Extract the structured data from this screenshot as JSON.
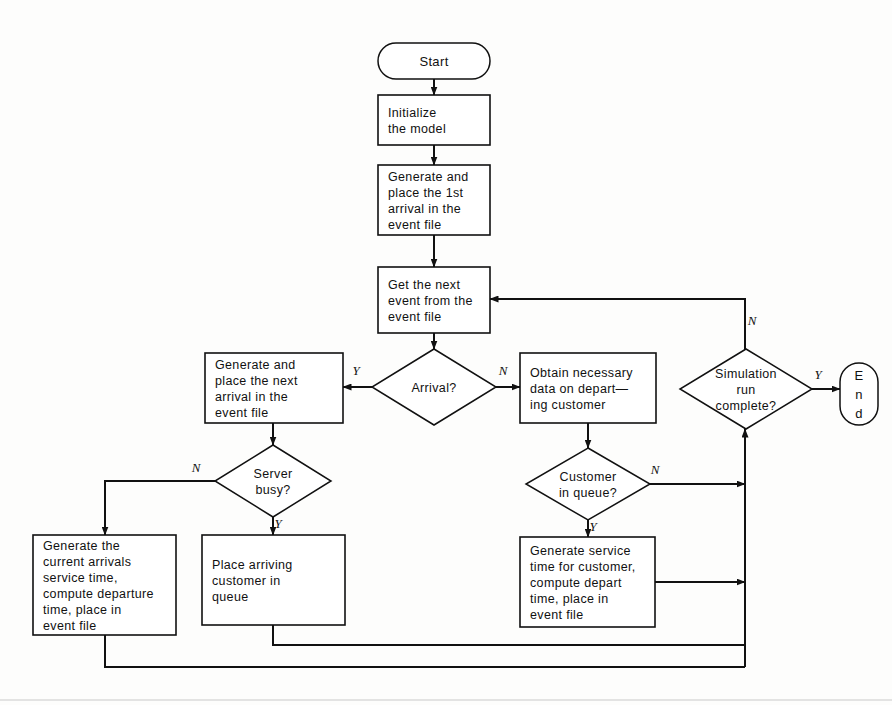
{
  "diagram": {
    "type": "flowchart",
    "canvas": {
      "width": 892,
      "height": 705
    },
    "colors": {
      "stroke": "#111111",
      "fill": "#ffffff",
      "background": "#fdfdfc"
    }
  },
  "nodes": {
    "start": {
      "id": "start",
      "shape": "terminal",
      "label": "Start",
      "lines": [
        "Start"
      ],
      "x": 378,
      "y": 43,
      "w": 112,
      "h": 36
    },
    "initialize": {
      "id": "initialize",
      "shape": "process",
      "lines": [
        "Initialize",
        "the model"
      ],
      "x": 378,
      "y": 95,
      "w": 112,
      "h": 50
    },
    "first_arrival": {
      "id": "first_arrival",
      "shape": "process",
      "lines": [
        "Generate and",
        "place the 1st",
        "arrival in the",
        "event file"
      ],
      "x": 378,
      "y": 165,
      "w": 112,
      "h": 70
    },
    "get_event": {
      "id": "get_event",
      "shape": "process",
      "lines": [
        "Get the next",
        "event from the",
        "event file"
      ],
      "x": 378,
      "y": 267,
      "w": 112,
      "h": 66
    },
    "arrival_q": {
      "id": "arrival_q",
      "shape": "decision",
      "lines": [
        "Arrival?"
      ],
      "cx": 434,
      "cy": 387,
      "rx": 62,
      "ry": 38
    },
    "next_arrival": {
      "id": "next_arrival",
      "shape": "process",
      "lines": [
        "Generate and",
        "place the next",
        "arrival in the",
        "event file"
      ],
      "x": 205,
      "y": 353,
      "w": 138,
      "h": 70
    },
    "obtain_data": {
      "id": "obtain_data",
      "shape": "process",
      "lines": [
        "Obtain necessary",
        "data on depart—",
        "ing customer"
      ],
      "x": 520,
      "y": 353,
      "w": 136,
      "h": 70
    },
    "sim_complete_q": {
      "id": "sim_complete_q",
      "shape": "decision",
      "lines": [
        "Simulation",
        "run",
        "complete?"
      ],
      "cx": 746,
      "cy": 389,
      "rx": 66,
      "ry": 40
    },
    "end": {
      "id": "end",
      "shape": "terminal",
      "label": "End",
      "lines": [
        "E",
        "n",
        "d"
      ],
      "x": 840,
      "y": 363,
      "w": 38,
      "h": 62
    },
    "server_busy_q": {
      "id": "server_busy_q",
      "shape": "decision",
      "lines": [
        "Server",
        "busy?"
      ],
      "cx": 273,
      "cy": 481,
      "rx": 58,
      "ry": 36
    },
    "customer_queue_q": {
      "id": "customer_queue_q",
      "shape": "decision",
      "lines": [
        "Customer",
        "in queue?"
      ],
      "cx": 588,
      "cy": 484,
      "rx": 62,
      "ry": 36
    },
    "gen_current_arrival": {
      "id": "gen_current_arrival",
      "shape": "process",
      "lines": [
        "Generate the",
        "current arrivals",
        "service time,",
        "compute departure",
        "time, place in",
        "event file"
      ],
      "x": 33,
      "y": 535,
      "w": 143,
      "h": 100
    },
    "place_customer": {
      "id": "place_customer",
      "shape": "process",
      "lines": [
        "Place arriving",
        "customer in",
        "queue"
      ],
      "x": 202,
      "y": 535,
      "w": 143,
      "h": 90
    },
    "gen_service_time": {
      "id": "gen_service_time",
      "shape": "process",
      "lines": [
        "Generate service",
        "time for customer,",
        "compute depart",
        "time, place in",
        "event file"
      ],
      "x": 520,
      "y": 537,
      "w": 135,
      "h": 90
    }
  },
  "edges": [
    {
      "id": "e-start-init",
      "from": "start",
      "to": "initialize",
      "label": "",
      "arrow": true,
      "points": "434,79 434,95"
    },
    {
      "id": "e-init-first",
      "from": "initialize",
      "to": "first_arrival",
      "label": "",
      "arrow": true,
      "points": "434,145 434,165"
    },
    {
      "id": "e-first-get",
      "from": "first_arrival",
      "to": "get_event",
      "label": "",
      "arrow": true,
      "points": "434,235 434,267"
    },
    {
      "id": "e-get-arrival",
      "from": "get_event",
      "to": "arrival_q",
      "label": "",
      "arrow": true,
      "points": "434,333 434,349"
    },
    {
      "id": "e-arrival-yes",
      "from": "arrival_q",
      "to": "next_arrival",
      "label": "Y",
      "arrow": true,
      "points": "372,387 343,387",
      "label_x": 356,
      "label_y": 375
    },
    {
      "id": "e-arrival-no",
      "from": "arrival_q",
      "to": "obtain_data",
      "label": "N",
      "arrow": true,
      "points": "496,387 520,387",
      "label_x": 503,
      "label_y": 375
    },
    {
      "id": "e-nextarrival-server",
      "from": "next_arrival",
      "to": "server_busy_q",
      "label": "",
      "arrow": true,
      "points": "273,423 273,445"
    },
    {
      "id": "e-obtain-customerq",
      "from": "obtain_data",
      "to": "customer_queue_q",
      "label": "",
      "arrow": true,
      "points": "588,423 588,448"
    },
    {
      "id": "e-server-no",
      "from": "server_busy_q",
      "to": "gen_current_arrival",
      "label": "N",
      "arrow": true,
      "points": "215,481 105,481 105,535",
      "label_x": 196,
      "label_y": 472
    },
    {
      "id": "e-server-yes",
      "from": "server_busy_q",
      "to": "place_customer",
      "label": "Y",
      "arrow": true,
      "points": "273,517 273,535",
      "label_x": 278,
      "label_y": 528
    },
    {
      "id": "e-customer-no",
      "from": "customer_queue_q",
      "to": "sim_complete_q",
      "label": "N",
      "arrow": true,
      "points": "650,484 745,484",
      "label_x": 655,
      "label_y": 474
    },
    {
      "id": "e-customer-yes",
      "from": "customer_queue_q",
      "to": "gen_service_time",
      "label": "Y",
      "arrow": true,
      "points": "588,520 588,537",
      "label_x": 593,
      "label_y": 531
    },
    {
      "id": "e-genservice-trunk",
      "from": "gen_service_time",
      "to": "sim_complete_q",
      "label": "",
      "arrow": true,
      "points": "655,582 745,582"
    },
    {
      "id": "e-placecustomer-bottom",
      "from": "place_customer",
      "to": "sim_complete_q",
      "label": "",
      "arrow": false,
      "points": "273,625 273,645 745,645"
    },
    {
      "id": "e-gencurrent-bottom",
      "from": "gen_current_arrival",
      "to": "sim_complete_q",
      "label": "",
      "arrow": false,
      "points": "105,635 105,667 745,667"
    },
    {
      "id": "e-trunk-sim",
      "from": "trunk",
      "to": "sim_complete_q",
      "label": "",
      "arrow": true,
      "points": "745,667 745,429"
    },
    {
      "id": "e-sim-yes-end",
      "from": "sim_complete_q",
      "to": "end",
      "label": "Y",
      "arrow": true,
      "points": "812,389 840,389",
      "label_x": 818,
      "label_y": 379
    },
    {
      "id": "e-sim-no-loop",
      "from": "sim_complete_q",
      "to": "get_event",
      "label": "N",
      "arrow": true,
      "points": "745,349 745,299 490,299",
      "label_x": 752,
      "label_y": 325
    }
  ],
  "labels": {
    "yes": "Y",
    "no": "N"
  }
}
